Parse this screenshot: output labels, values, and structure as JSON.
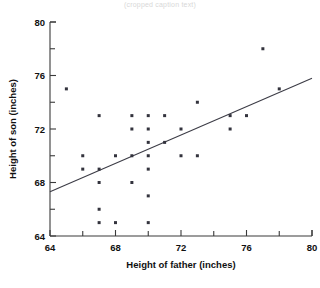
{
  "caption": {
    "partial_text": "(cropped caption text)"
  },
  "chart_data": {
    "type": "scatter",
    "title": "",
    "xlabel": "Height of father (inches)",
    "ylabel": "Height of son (inches)",
    "xlim": [
      64,
      80
    ],
    "ylim": [
      64,
      80
    ],
    "xticks": [
      64,
      68,
      72,
      76,
      80
    ],
    "xtick_labels": [
      "64",
      "68",
      "72",
      "76",
      "80"
    ],
    "xminor_ticks": [
      66,
      70,
      74,
      78
    ],
    "yticks": [
      64,
      68,
      72,
      76,
      80
    ],
    "ytick_labels": [
      "64",
      "68",
      "72",
      "76",
      "80"
    ],
    "yminor_ticks": [
      66,
      70,
      74,
      78
    ],
    "grid": false,
    "legend": null,
    "points": [
      {
        "x": 65.0,
        "y": 75.0
      },
      {
        "x": 66.0,
        "y": 70.0
      },
      {
        "x": 66.0,
        "y": 69.0
      },
      {
        "x": 67.0,
        "y": 73.0
      },
      {
        "x": 67.0,
        "y": 69.0
      },
      {
        "x": 67.0,
        "y": 68.0
      },
      {
        "x": 67.0,
        "y": 66.0
      },
      {
        "x": 67.0,
        "y": 65.0
      },
      {
        "x": 68.0,
        "y": 70.0
      },
      {
        "x": 68.0,
        "y": 65.0
      },
      {
        "x": 69.0,
        "y": 73.0
      },
      {
        "x": 69.0,
        "y": 72.0
      },
      {
        "x": 69.0,
        "y": 70.0
      },
      {
        "x": 69.0,
        "y": 68.0
      },
      {
        "x": 70.0,
        "y": 73.0
      },
      {
        "x": 70.0,
        "y": 72.0
      },
      {
        "x": 70.0,
        "y": 71.0
      },
      {
        "x": 70.0,
        "y": 70.0
      },
      {
        "x": 70.0,
        "y": 69.0
      },
      {
        "x": 70.0,
        "y": 67.0
      },
      {
        "x": 70.0,
        "y": 65.0
      },
      {
        "x": 71.0,
        "y": 73.0
      },
      {
        "x": 71.0,
        "y": 71.0
      },
      {
        "x": 72.0,
        "y": 72.0
      },
      {
        "x": 72.0,
        "y": 70.0
      },
      {
        "x": 73.0,
        "y": 74.0
      },
      {
        "x": 73.0,
        "y": 70.0
      },
      {
        "x": 75.0,
        "y": 73.0
      },
      {
        "x": 75.0,
        "y": 72.0
      },
      {
        "x": 76.0,
        "y": 73.0
      },
      {
        "x": 77.0,
        "y": 78.0
      },
      {
        "x": 78.0,
        "y": 75.0
      }
    ],
    "fit_line": {
      "label": "regression-line",
      "x_start": 64.0,
      "y_start": 67.3,
      "x_end": 80.0,
      "y_end": 75.8
    },
    "colors": {
      "point": "#33333d",
      "line": "#3c3c46",
      "axis": "#3a3a3a",
      "text": "#111111",
      "background": "#ffffff"
    }
  }
}
